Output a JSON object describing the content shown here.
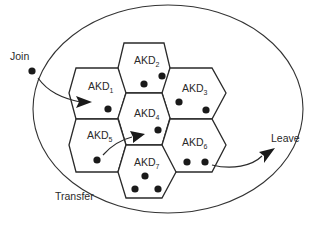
{
  "diagram": {
    "type": "hexagonal-cell-cluster",
    "boundary": {
      "shape": "ellipse",
      "cx": 168,
      "cy": 109,
      "rx": 135,
      "ry": 104
    },
    "cells": [
      {
        "id": "AKD1",
        "label": "AKD",
        "sub": "1",
        "cx": 94,
        "cy": 93,
        "members": [
          [
            108,
            109
          ]
        ]
      },
      {
        "id": "AKD2",
        "label": "AKD",
        "sub": "2",
        "cx": 144,
        "cy": 68,
        "members": [
          [
            144,
            84
          ],
          [
            162,
            76
          ]
        ]
      },
      {
        "id": "AKD3",
        "label": "AKD",
        "sub": "3",
        "cx": 194,
        "cy": 93,
        "members": [
          [
            179,
            102
          ],
          [
            206,
            110
          ]
        ]
      },
      {
        "id": "AKD4",
        "label": "AKD",
        "sub": "4",
        "cx": 144,
        "cy": 118,
        "members": [
          [
            158,
            130
          ]
        ]
      },
      {
        "id": "AKD5",
        "label": "AKD",
        "sub": "5",
        "cx": 94,
        "cy": 143,
        "members": [
          [
            97,
            160
          ]
        ]
      },
      {
        "id": "AKD6",
        "label": "AKD",
        "sub": "6",
        "cx": 194,
        "cy": 143,
        "members": [
          [
            187,
            162
          ],
          [
            205,
            162
          ]
        ]
      },
      {
        "id": "AKD7",
        "label": "AKD",
        "sub": "7",
        "cx": 144,
        "cy": 168,
        "members": [
          [
            145,
            176
          ],
          [
            135,
            189
          ],
          [
            158,
            189
          ]
        ]
      }
    ],
    "events": {
      "join": {
        "label": "Join",
        "from": "outside",
        "to": "AKD1",
        "dot": [
          32,
          71
        ]
      },
      "transfer": {
        "label": "Transfer",
        "from": "AKD5",
        "to": "AKD4"
      },
      "leave": {
        "label": "Leave",
        "from": "AKD6",
        "to": "outside"
      }
    }
  },
  "labels": {
    "join": "Join",
    "transfer": "Transfer",
    "leave": "Leave",
    "akd": "AKD",
    "sub1": "1",
    "sub2": "2",
    "sub3": "3",
    "sub4": "4",
    "sub5": "5",
    "sub6": "6",
    "sub7": "7"
  }
}
